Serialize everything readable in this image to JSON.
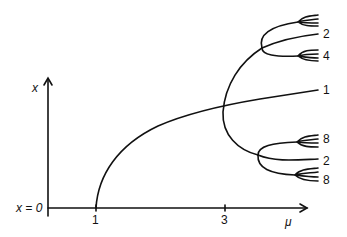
{
  "figure": {
    "type": "bifurcation-diagram",
    "axes": {
      "y_label": "x",
      "x_label": "μ",
      "origin_label": "x = 0",
      "x_ticks": [
        "1",
        "3"
      ]
    },
    "branch_labels": {
      "main_branch": "1",
      "upper_period2": "2",
      "upper_period4": "4",
      "lower_period8_top": "8",
      "lower_period2": "2",
      "lower_period8_bottom": "8"
    },
    "colors": {
      "line": "#111111",
      "background": "#ffffff"
    }
  }
}
